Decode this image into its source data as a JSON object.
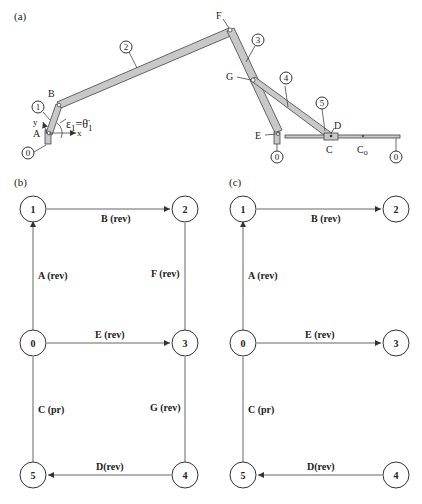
{
  "panels": {
    "a": {
      "label": "(a)",
      "joints": {
        "A": "A",
        "B": "B",
        "C": "C",
        "D": "D",
        "E": "E",
        "F": "F",
        "G": "G",
        "Co": "C",
        "Co_sub": "o"
      },
      "links": {
        "l0a": "0",
        "l1": "1",
        "l2": "2",
        "l3": "3",
        "l4": "4",
        "l5": "5",
        "l0b": "0",
        "l0c": "0"
      },
      "axes": {
        "x": "x",
        "y": "y"
      },
      "accel": "ε",
      "accel_sub": "1",
      "accel_eq": "=",
      "theta": "θ̈",
      "theta_sub": "1"
    },
    "b": {
      "label": "(b)",
      "nodes": [
        "0",
        "1",
        "2",
        "3",
        "4",
        "5"
      ],
      "edges": {
        "A": "A (rev)",
        "B": "B (rev)",
        "E": "E (rev)",
        "F": "F (rev)",
        "C": "C (pr)",
        "G": "G (rev)",
        "D": "D(rev)"
      }
    },
    "c": {
      "label": "(c)",
      "nodes": [
        "0",
        "1",
        "2",
        "3",
        "4",
        "5"
      ],
      "edges": {
        "A": "A (rev)",
        "B": "B (rev)",
        "E": "E (rev)",
        "C": "C (pr)",
        "D": "D(rev)"
      }
    }
  }
}
